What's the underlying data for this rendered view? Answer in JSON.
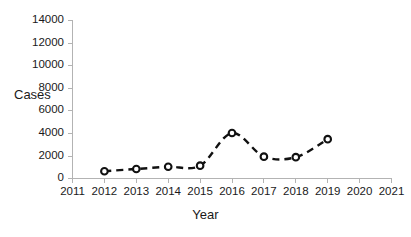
{
  "chart_data": {
    "type": "line",
    "title": "",
    "xlabel": "Year",
    "ylabel": "Cases",
    "x": [
      2012,
      2013,
      2014,
      2015,
      2016,
      2017,
      2018,
      2019
    ],
    "values": [
      600,
      800,
      1000,
      1100,
      4000,
      1900,
      1850,
      3450
    ],
    "series": [
      {
        "name": "Cases",
        "x": [
          2012,
          2013,
          2014,
          2015,
          2016,
          2017,
          2018,
          2019
        ],
        "values": [
          600,
          800,
          1000,
          1100,
          4000,
          1900,
          1850,
          3450
        ]
      }
    ],
    "xlim": [
      2011,
      2021
    ],
    "ylim": [
      0,
      14000
    ],
    "x_ticks": [
      "2011",
      "2012",
      "2013",
      "2014",
      "2015",
      "2016",
      "2017",
      "2018",
      "2019",
      "2020",
      "2021"
    ],
    "y_ticks": [
      "0",
      "2000",
      "4000",
      "6000",
      "8000",
      "10000",
      "12000",
      "14000"
    ],
    "y_tick_values": [
      0,
      2000,
      4000,
      6000,
      8000,
      10000,
      12000,
      14000
    ],
    "grid": false,
    "legend": false,
    "legend_position": "none",
    "line_style": "dashed",
    "marker_style": "open-circle",
    "series_color": "#111111",
    "axis_color": "#b3b3b3",
    "background_color": "#ffffff"
  }
}
